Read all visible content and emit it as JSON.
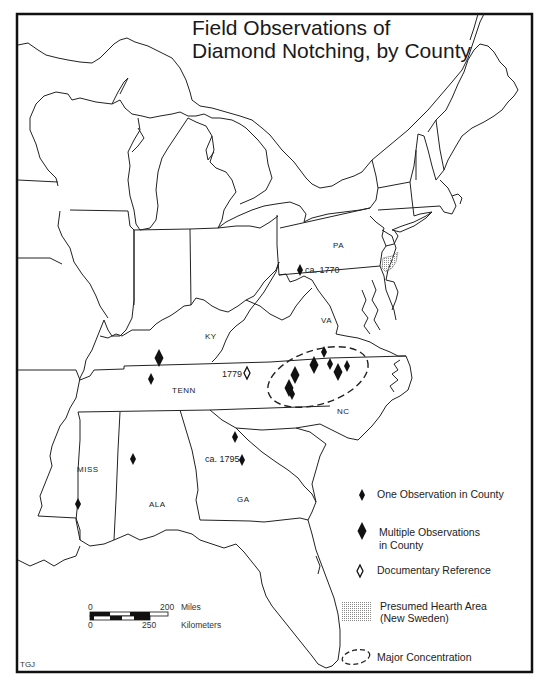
{
  "title": {
    "line1": "Field Observations of",
    "line2": "Diamond Notching, by County"
  },
  "state_labels": {
    "pa": "PA",
    "va": "VA",
    "ky": "KY",
    "tenn": "TENN",
    "nc": "NC",
    "miss": "MISS",
    "ala": "ALA",
    "ga": "GA"
  },
  "annotations": {
    "pa_date": "ca. 1770",
    "tenn_date": "1779",
    "ga_date": "ca. 1795"
  },
  "legend": {
    "one_observation": "One Observation in County",
    "multiple_line1": "Multiple Observations",
    "multiple_line2": "in County",
    "documentary": "Documentary Reference",
    "hearth_line1": "Presumed Hearth Area",
    "hearth_line2": "(New Sweden)",
    "concentration": "Major Concentration"
  },
  "scale_bar": {
    "miles_zero": "0",
    "miles_max": "200",
    "miles_unit": "Miles",
    "km_zero": "0",
    "km_max": "250",
    "km_unit": "Kilometers"
  },
  "credit": "TGJ",
  "colors": {
    "ink": "#1a1a1a",
    "paper": "#ffffff",
    "hatch": "#9a9a9a"
  },
  "markers": {
    "single_observation": [
      {
        "state": "PA",
        "x": 300,
        "y": 270
      },
      {
        "state": "TENN",
        "x": 151,
        "y": 379
      },
      {
        "state": "VA",
        "x": 324,
        "y": 352
      },
      {
        "state": "VA",
        "x": 330,
        "y": 364
      },
      {
        "state": "VA",
        "x": 347,
        "y": 366
      },
      {
        "state": "NC",
        "x": 292,
        "y": 394
      },
      {
        "state": "GA",
        "x": 235,
        "y": 437
      },
      {
        "state": "GA",
        "x": 242,
        "y": 460
      },
      {
        "state": "ALA",
        "x": 133,
        "y": 459
      },
      {
        "state": "MISS",
        "x": 78,
        "y": 504
      }
    ],
    "multiple_observations": [
      {
        "state": "KY",
        "x": 159,
        "y": 358
      },
      {
        "state": "VA",
        "x": 314,
        "y": 365
      },
      {
        "state": "VA",
        "x": 338,
        "y": 372
      },
      {
        "state": "NC",
        "x": 295,
        "y": 375
      },
      {
        "state": "NC",
        "x": 289,
        "y": 388
      }
    ],
    "documentary_reference": [
      {
        "state": "TENN",
        "x": 247,
        "y": 373
      }
    ]
  }
}
